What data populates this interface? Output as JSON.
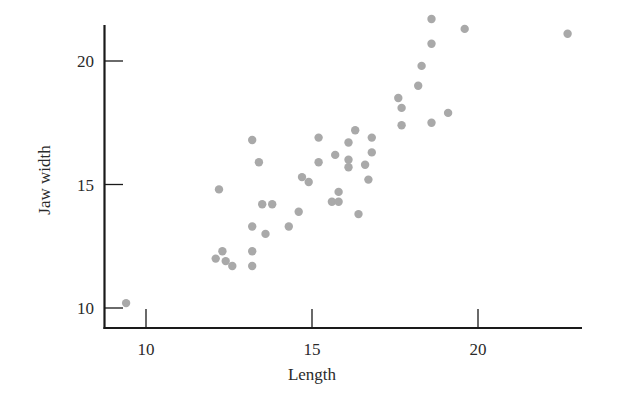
{
  "chart_data": {
    "type": "scatter",
    "title": "",
    "xlabel": "Length",
    "ylabel": "Jaw width",
    "xlim": [
      8.7,
      23.2
    ],
    "ylim": [
      9.2,
      21.5
    ],
    "xticks": [
      10,
      15,
      20
    ],
    "yticks": [
      10,
      15,
      20
    ],
    "xtick_labels": [
      "10",
      "15",
      "20"
    ],
    "ytick_labels": [
      "10",
      "15",
      "20"
    ],
    "grid": false,
    "legend": null,
    "marker_color": "#a9a9a9",
    "series": [
      {
        "name": "observations",
        "points": [
          {
            "x": 9.4,
            "y": 10.2
          },
          {
            "x": 12.1,
            "y": 12.0
          },
          {
            "x": 12.2,
            "y": 14.8
          },
          {
            "x": 12.3,
            "y": 12.3
          },
          {
            "x": 12.4,
            "y": 11.9
          },
          {
            "x": 12.6,
            "y": 11.7
          },
          {
            "x": 13.2,
            "y": 16.8
          },
          {
            "x": 13.2,
            "y": 13.3
          },
          {
            "x": 13.2,
            "y": 12.3
          },
          {
            "x": 13.2,
            "y": 11.7
          },
          {
            "x": 13.4,
            "y": 15.9
          },
          {
            "x": 13.5,
            "y": 14.2
          },
          {
            "x": 13.6,
            "y": 13.0
          },
          {
            "x": 13.8,
            "y": 14.2
          },
          {
            "x": 14.3,
            "y": 13.3
          },
          {
            "x": 14.6,
            "y": 13.9
          },
          {
            "x": 14.7,
            "y": 15.3
          },
          {
            "x": 14.9,
            "y": 15.1
          },
          {
            "x": 15.2,
            "y": 15.9
          },
          {
            "x": 15.2,
            "y": 16.9
          },
          {
            "x": 15.7,
            "y": 16.2
          },
          {
            "x": 15.6,
            "y": 14.3
          },
          {
            "x": 15.8,
            "y": 14.3
          },
          {
            "x": 15.8,
            "y": 14.7
          },
          {
            "x": 16.1,
            "y": 16.0
          },
          {
            "x": 16.1,
            "y": 15.7
          },
          {
            "x": 16.1,
            "y": 16.7
          },
          {
            "x": 16.3,
            "y": 17.2
          },
          {
            "x": 16.4,
            "y": 13.8
          },
          {
            "x": 16.6,
            "y": 15.8
          },
          {
            "x": 16.7,
            "y": 15.2
          },
          {
            "x": 16.8,
            "y": 16.9
          },
          {
            "x": 16.8,
            "y": 16.3
          },
          {
            "x": 17.6,
            "y": 18.5
          },
          {
            "x": 17.7,
            "y": 18.1
          },
          {
            "x": 17.7,
            "y": 17.4
          },
          {
            "x": 18.2,
            "y": 19.0
          },
          {
            "x": 18.3,
            "y": 19.8
          },
          {
            "x": 18.6,
            "y": 21.7
          },
          {
            "x": 18.6,
            "y": 20.7
          },
          {
            "x": 18.6,
            "y": 17.5
          },
          {
            "x": 19.1,
            "y": 17.9
          },
          {
            "x": 19.6,
            "y": 21.3
          },
          {
            "x": 22.7,
            "y": 21.1
          }
        ]
      }
    ]
  },
  "layout": {
    "plot_left_px": 104,
    "plot_bottom_px": 328,
    "plot_right_px": 582,
    "plot_top_px": 25,
    "x_ref": {
      "value": 10,
      "px": 146
    },
    "x_px_per_unit": 33.2,
    "y_ref": {
      "value": 20,
      "px": 61
    },
    "y_px_per_unit": 24.7
  }
}
